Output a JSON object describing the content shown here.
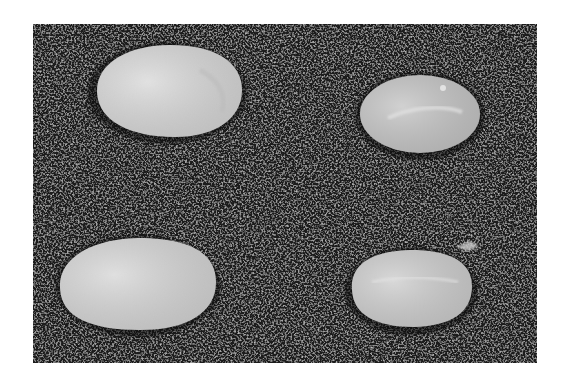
{
  "image": {
    "description": "Grayscale photograph of four rice grains on a dark speckled background",
    "background_color": "#ffffff",
    "photo_bg_color": "#1e1e1e",
    "grain_color": "#d6d6d6",
    "grains": [
      {
        "id": "top-left",
        "cx": 167,
        "cy": 91,
        "rx": 75,
        "ry": 46,
        "shade": "#dcdcdc"
      },
      {
        "id": "top-right",
        "cx": 420,
        "cy": 114,
        "rx": 60,
        "ry": 39,
        "shade": "#c4c4c4"
      },
      {
        "id": "bottom-left",
        "cx": 138,
        "cy": 284,
        "rx": 78,
        "ry": 46,
        "shade": "#dadada"
      },
      {
        "id": "bottom-right",
        "cx": 411,
        "cy": 289,
        "rx": 62,
        "ry": 39,
        "shade": "#d0d0d0"
      }
    ],
    "caption": "Four rice grains"
  }
}
